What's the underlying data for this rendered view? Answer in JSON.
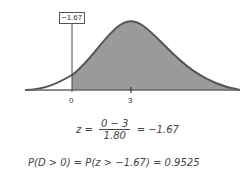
{
  "chart": {
    "type": "normal-distribution",
    "mean": 3,
    "sd": 1.8,
    "shade_from": 0,
    "marker_label": "−1.67",
    "tick_labels": [
      "0",
      "3"
    ],
    "colors": {
      "fill": "#9a9a9a",
      "curve": "#555555",
      "axis": "#666666"
    }
  },
  "equations": {
    "z_lhs": "z =",
    "z_num": "0 − 3",
    "z_den": "1.80",
    "z_rhs": "= −1.67",
    "prob": "P(D > 0) = P(z > −1.67) = 0.9525"
  }
}
